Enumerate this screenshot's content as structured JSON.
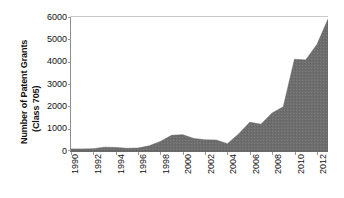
{
  "chart_data": {
    "type": "area",
    "title": "",
    "xlabel": "",
    "ylabel": "Number of Patent Grants (Class 705)",
    "ylabel_lines": [
      "Number of Patent Grants",
      "(Class 705)"
    ],
    "ylim": [
      0,
      6000
    ],
    "xlim": [
      1990,
      2013
    ],
    "grid": false,
    "legend": false,
    "fill_color": "#6e6e6e",
    "yticks": [
      6000,
      5000,
      4000,
      3000,
      2000,
      1000,
      0
    ],
    "ytick_labels": [
      "6000",
      "5000",
      "4000",
      "3000",
      "2000",
      "1000",
      "0"
    ],
    "xticks": [
      1990,
      1992,
      1994,
      1996,
      1998,
      2000,
      2002,
      2004,
      2006,
      2008,
      2010,
      2012
    ],
    "xtick_labels": [
      "1990",
      "1992",
      "1994",
      "1996",
      "1998",
      "2000",
      "2002",
      "2004",
      "2006",
      "2008",
      "2010",
      "2012"
    ],
    "x": [
      1990,
      1991,
      1992,
      1993,
      1994,
      1995,
      1996,
      1997,
      1998,
      1999,
      2000,
      2001,
      2002,
      2003,
      2004,
      2005,
      2006,
      2007,
      2008,
      2009,
      2010,
      2011,
      2012,
      2013
    ],
    "values": [
      95,
      95,
      105,
      170,
      160,
      120,
      130,
      230,
      430,
      700,
      730,
      560,
      500,
      490,
      330,
      760,
      1290,
      1200,
      1700,
      1980,
      4110,
      4080,
      4760,
      5900
    ]
  }
}
